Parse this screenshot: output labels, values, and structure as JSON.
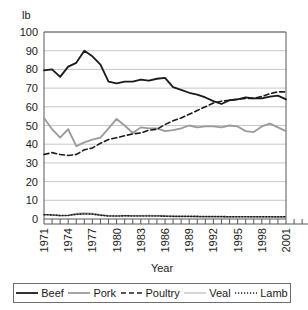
{
  "unit_label": "lb",
  "axis": {
    "x_title": "Year",
    "y_title": "lb"
  },
  "legend": {
    "items": [
      {
        "label": "Beef",
        "style": "solid-thick",
        "color": "#1a1a1a"
      },
      {
        "label": "Pork",
        "style": "solid-thick",
        "color": "#9a9a9a"
      },
      {
        "label": "Poultry",
        "style": "dashed",
        "color": "#1a1a1a"
      },
      {
        "label": "Veal",
        "style": "solid-thin",
        "color": "#b5b5b5"
      },
      {
        "label": "Lamb",
        "style": "dotted",
        "color": "#1a1a1a"
      }
    ]
  },
  "chart_data": {
    "type": "line",
    "title": "",
    "xlabel": "Year",
    "ylabel": "lb",
    "ylim": [
      0,
      100
    ],
    "yticks": [
      0,
      10,
      20,
      30,
      40,
      50,
      60,
      70,
      80,
      90,
      100
    ],
    "grid": true,
    "legend_position": "bottom",
    "x": [
      1971,
      1972,
      1973,
      1974,
      1975,
      1976,
      1977,
      1978,
      1979,
      1980,
      1981,
      1982,
      1983,
      1984,
      1985,
      1986,
      1987,
      1988,
      1989,
      1990,
      1991,
      1992,
      1993,
      1994,
      1995,
      1996,
      1997,
      1998,
      1999,
      2000,
      2001
    ],
    "xtick_labels": [
      "1971",
      "1974",
      "1977",
      "1980",
      "1983",
      "1986",
      "1989",
      "1992",
      "1995",
      "1998",
      "2001"
    ],
    "xtick_values": [
      1971,
      1974,
      1977,
      1980,
      1983,
      1986,
      1989,
      1992,
      1995,
      1998,
      2001
    ],
    "series": [
      {
        "name": "Beef",
        "color": "#1a1a1a",
        "style": "solid-thick",
        "values": [
          79.5,
          80.0,
          76.0,
          81.5,
          83.5,
          90.0,
          87.0,
          82.5,
          73.5,
          72.5,
          73.5,
          73.5,
          74.5,
          74.0,
          75.0,
          75.5,
          70.5,
          69.0,
          67.5,
          66.5,
          65.0,
          63.0,
          61.5,
          63.5,
          64.0,
          65.0,
          64.5,
          64.5,
          65.5,
          66.0,
          64.0
        ]
      },
      {
        "name": "Pork",
        "color": "#9a9a9a",
        "style": "solid-thick",
        "values": [
          54.0,
          48.0,
          43.5,
          48.0,
          39.0,
          41.0,
          42.5,
          43.5,
          48.5,
          53.5,
          50.0,
          46.0,
          49.0,
          48.5,
          48.5,
          47.0,
          47.5,
          48.5,
          50.0,
          49.0,
          49.5,
          49.5,
          49.0,
          50.0,
          49.5,
          47.0,
          46.5,
          49.5,
          51.0,
          49.0,
          47.0
        ]
      },
      {
        "name": "Poultry",
        "color": "#1a1a1a",
        "style": "dashed",
        "values": [
          34.5,
          35.5,
          34.5,
          34.0,
          34.5,
          37.0,
          38.0,
          40.5,
          42.5,
          43.5,
          44.5,
          45.5,
          46.0,
          47.5,
          48.0,
          50.5,
          52.5,
          54.0,
          56.0,
          58.0,
          60.0,
          62.0,
          63.0,
          63.5,
          64.0,
          64.5,
          64.5,
          65.5,
          67.0,
          68.0,
          68.0
        ]
      },
      {
        "name": "Veal",
        "color": "#b5b5b5",
        "style": "solid-thin",
        "values": [
          2.4,
          2.0,
          1.6,
          1.9,
          3.0,
          3.3,
          3.1,
          2.4,
          1.8,
          1.6,
          1.8,
          1.9,
          1.9,
          2.0,
          1.9,
          1.8,
          1.6,
          1.5,
          1.3,
          1.1,
          1.0,
          1.0,
          1.0,
          1.0,
          1.1,
          1.1,
          1.0,
          0.9,
          0.9,
          0.8,
          0.8
        ]
      },
      {
        "name": "Lamb",
        "color": "#1a1a1a",
        "style": "dotted",
        "values": [
          2.3,
          2.2,
          1.9,
          1.9,
          2.5,
          2.7,
          2.6,
          2.0,
          1.6,
          1.6,
          1.7,
          1.6,
          1.6,
          1.6,
          1.6,
          1.5,
          1.4,
          1.4,
          1.4,
          1.4,
          1.3,
          1.3,
          1.3,
          1.2,
          1.2,
          1.2,
          1.2,
          1.2,
          1.2,
          1.2,
          1.2
        ]
      }
    ]
  }
}
